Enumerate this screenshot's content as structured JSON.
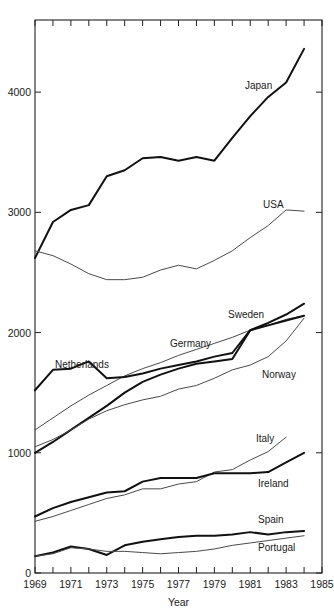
{
  "chart_data": {
    "type": "line",
    "title": "",
    "xlabel": "Year",
    "ylabel": "",
    "xlim": [
      1969,
      1985
    ],
    "ylim": [
      0,
      4600
    ],
    "grid": false,
    "legend_position": "inline-end-of-line",
    "x_tick_labels": [
      "1969",
      "1971",
      "1973",
      "1975",
      "1977",
      "1979",
      "1981",
      "1983",
      "1985"
    ],
    "x_tick_values": [
      1969,
      1971,
      1973,
      1975,
      1977,
      1979,
      1981,
      1983,
      1985
    ],
    "x_minor_ticks": [
      1970,
      1972,
      1974,
      1976,
      1978,
      1980,
      1982,
      1984
    ],
    "y_tick_labels": [
      "0",
      "1000",
      "2000",
      "3000",
      "4000"
    ],
    "y_tick_values": [
      0,
      1000,
      2000,
      3000,
      4000
    ],
    "x": [
      1969,
      1970,
      1971,
      1972,
      1973,
      1974,
      1975,
      1976,
      1977,
      1978,
      1979,
      1980,
      1981,
      1982,
      1983,
      1984
    ],
    "series": [
      {
        "name": "Japan",
        "label": "Japan",
        "style": "thick",
        "values": [
          2620,
          2920,
          3020,
          3060,
          3300,
          3350,
          3450,
          3460,
          3430,
          3460,
          3430,
          3620,
          3800,
          3960,
          4080,
          4360
        ]
      },
      {
        "name": "USA",
        "label": "USA",
        "style": "thin",
        "values": [
          2680,
          2640,
          2570,
          2490,
          2440,
          2440,
          2460,
          2520,
          2560,
          2530,
          2600,
          2680,
          2790,
          2890,
          3020,
          3010
        ]
      },
      {
        "name": "Sweden",
        "label": "Sweden",
        "style": "thick",
        "values": [
          1000,
          1090,
          1190,
          1290,
          1390,
          1500,
          1590,
          1650,
          1700,
          1740,
          1760,
          1780,
          2020,
          2080,
          2150,
          2240
        ]
      },
      {
        "name": "Germany",
        "label": "Germany",
        "style": "thin",
        "values": [
          1190,
          1290,
          1390,
          1480,
          1560,
          1640,
          1700,
          1750,
          1810,
          1860,
          1910,
          1960,
          2020,
          2060,
          2110,
          2140
        ]
      },
      {
        "name": "Netherlands",
        "label": "Netherlands",
        "style": "thick",
        "values": [
          1520,
          1690,
          1700,
          1760,
          1620,
          1630,
          1660,
          1700,
          1730,
          1760,
          1800,
          1830,
          2020,
          2060,
          2100,
          2140
        ]
      },
      {
        "name": "Norway",
        "label": "Norway",
        "style": "thin",
        "values": [
          1050,
          1110,
          1190,
          1280,
          1350,
          1400,
          1440,
          1470,
          1530,
          1560,
          1620,
          1690,
          1730,
          1800,
          1930,
          2120
        ]
      },
      {
        "name": "Italy",
        "label": "Italy",
        "style": "thin",
        "values": [
          430,
          470,
          520,
          570,
          620,
          650,
          700,
          700,
          740,
          760,
          840,
          860,
          940,
          1010,
          1130,
          0
        ]
      },
      {
        "name": "Ireland",
        "label": "Ireland",
        "style": "thick",
        "values": [
          470,
          540,
          590,
          630,
          670,
          680,
          760,
          790,
          790,
          790,
          830,
          830,
          830,
          840,
          920,
          1000
        ]
      },
      {
        "name": "Spain",
        "label": "Spain",
        "style": "thick",
        "values": [
          140,
          170,
          220,
          200,
          150,
          230,
          260,
          280,
          300,
          310,
          310,
          320,
          340,
          320,
          340,
          350
        ]
      },
      {
        "name": "Portugal",
        "label": "Portugal",
        "style": "thin",
        "values": [
          140,
          160,
          210,
          200,
          180,
          180,
          170,
          160,
          170,
          180,
          200,
          230,
          250,
          270,
          290,
          310
        ]
      }
    ],
    "annotations": [
      {
        "text": "Japan",
        "x": 245,
        "y": 89
      },
      {
        "text": "USA",
        "x": 263,
        "y": 208
      },
      {
        "text": "Sweden",
        "x": 228,
        "y": 318
      },
      {
        "text": "Germany",
        "x": 170,
        "y": 347
      },
      {
        "text": "Netherlands",
        "x": 55,
        "y": 368
      },
      {
        "text": "Norway",
        "x": 262,
        "y": 378
      },
      {
        "text": "Italy",
        "x": 256,
        "y": 442
      },
      {
        "text": "Ireland",
        "x": 258,
        "y": 487
      },
      {
        "text": "Spain",
        "x": 258,
        "y": 523
      },
      {
        "text": "Portugal",
        "x": 258,
        "y": 551
      }
    ],
    "colors": {
      "thick_line": "#111111",
      "thin_line": "#4a4a4a",
      "axis": "#222222",
      "text": "#1a1a1a",
      "background": "#ffffff"
    }
  }
}
